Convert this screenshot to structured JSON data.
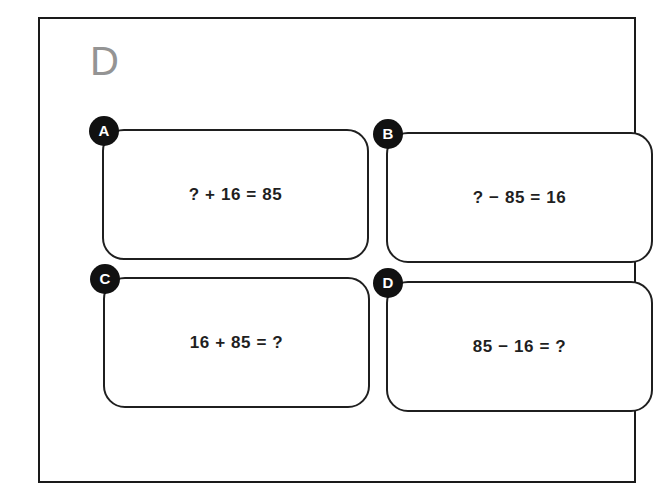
{
  "figure": {
    "panel_letter": "D",
    "panel_letter_color": "#949494",
    "frame_color": "#1a1a1a",
    "background_color": "#ffffff",
    "badge_background_color": "#111111",
    "badge_text_color": "#ffffff",
    "card_border_color": "#1f1f1f",
    "equation_text_color": "#1f1f1f"
  },
  "cards": [
    {
      "badge": "A",
      "equation": "? + 16 = 85"
    },
    {
      "badge": "B",
      "equation": "? − 85 = 16"
    },
    {
      "badge": "C",
      "equation": "16 + 85 = ?"
    },
    {
      "badge": "D",
      "equation": "85 − 16 = ?"
    }
  ]
}
